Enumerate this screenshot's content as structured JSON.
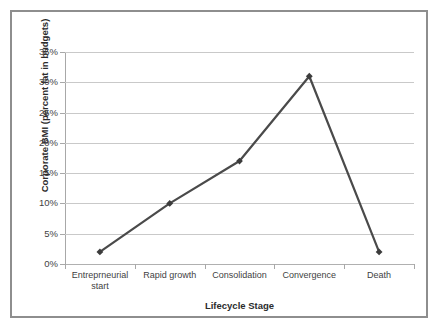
{
  "chart_data": {
    "type": "line",
    "title": "",
    "xlabel": "Lifecycle Stage",
    "ylabel": "Corporate BMI (percent fat in budgets)",
    "categories": [
      "Entreprneurial start",
      "Rapid growth",
      "Consolidation",
      "Convergence",
      "Death"
    ],
    "values": [
      2,
      10,
      17,
      31,
      2
    ],
    "ytick_labels": [
      "0%",
      "5%",
      "10%",
      "15%",
      "20%",
      "25%",
      "30%",
      "35%"
    ],
    "ytick_values": [
      0,
      5,
      10,
      15,
      20,
      25,
      30,
      35
    ],
    "ylim": [
      0,
      35
    ],
    "grid": true,
    "legend": "none",
    "series": [
      {
        "name": "Corporate BMI",
        "values": [
          2,
          10,
          17,
          31,
          2
        ],
        "line_color": "#4a4a4a",
        "marker": "diamond",
        "marker_color": "#3c3c3c"
      }
    ]
  },
  "style": {
    "frame_border_color": "#8e8e8e",
    "gridline_color": "#c9c9c9",
    "axis_color": "#a8a8a8",
    "text_color": "#3f3f3f",
    "title_color": "#2b2b2b",
    "background": "#ffffff"
  }
}
